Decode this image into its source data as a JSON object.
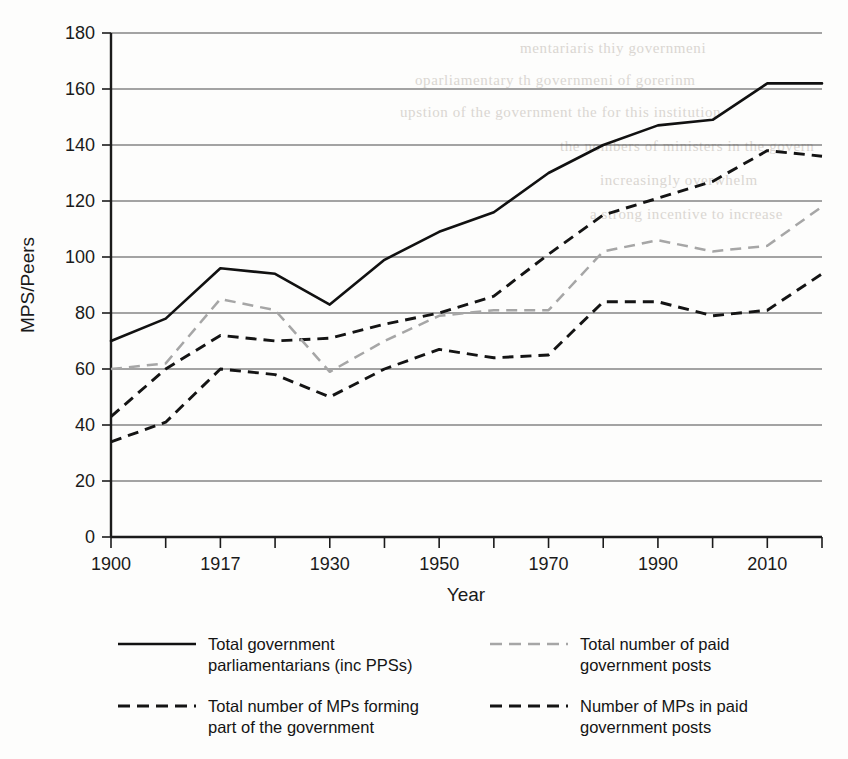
{
  "chart_data": {
    "type": "line",
    "title": "",
    "xlabel": "Year",
    "ylabel": "MPS/Peers",
    "ylim": [
      0,
      180
    ],
    "ytick_step": 20,
    "yticks": [
      0,
      20,
      40,
      60,
      80,
      100,
      120,
      140,
      160,
      180
    ],
    "grid": "horizontal",
    "legend_position": "below",
    "x": [
      1900,
      1910,
      1917,
      1924,
      1930,
      1940,
      1950,
      1960,
      1970,
      1980,
      1990,
      2000,
      2010,
      2020
    ],
    "xticks_labeled": [
      "1900",
      "",
      "1917",
      "",
      "1930",
      "",
      "1950",
      "",
      "1970",
      "",
      "1990",
      "",
      "2010",
      ""
    ],
    "xtick_labels_visible": [
      "1900",
      "1917",
      "1930",
      "1950",
      "1970",
      "1990",
      "2010"
    ],
    "series": [
      {
        "name": "Total government parliamentarians (inc PPSs)",
        "style": "solid",
        "color": "#111111",
        "values": [
          70,
          78,
          96,
          94,
          83,
          99,
          109,
          116,
          130,
          140,
          147,
          149,
          162,
          162
        ]
      },
      {
        "name": "Total number of MPs forming part of the government",
        "style": "dashed",
        "color": "#141414",
        "values": [
          43,
          60,
          72,
          70,
          71,
          76,
          80,
          86,
          101,
          115,
          121,
          127,
          138,
          136
        ]
      },
      {
        "name": "Total number of paid government posts",
        "style": "dashed-light",
        "color": "#a6a6a6",
        "values": [
          60,
          62,
          85,
          81,
          59,
          70,
          79,
          81,
          81,
          102,
          106,
          102,
          104,
          118
        ]
      },
      {
        "name": "Number of MPs in paid government posts",
        "style": "dashed",
        "color": "#141414",
        "values": [
          34,
          41,
          60,
          58,
          50,
          60,
          67,
          64,
          65,
          84,
          84,
          79,
          81,
          94
        ]
      }
    ]
  },
  "axes": {
    "y_title": "MPS/Peers",
    "x_title": "Year",
    "y_labels": [
      "180",
      "160",
      "140",
      "120",
      "100",
      "80",
      "60",
      "40",
      "20",
      "0"
    ],
    "x_labels": [
      "1900",
      "1917",
      "1930",
      "1950",
      "1970",
      "1990",
      "2010"
    ]
  },
  "legend": {
    "entries": [
      {
        "label": "Total government\nparliamentarians (inc PPSs)",
        "style": "solid",
        "color": "#111111"
      },
      {
        "label": "Total number of MPs forming\npart of the government",
        "style": "dashed",
        "color": "#141414"
      },
      {
        "label": "Total number of paid\ngovernment posts",
        "style": "dashed-light",
        "color": "#a6a6a6"
      },
      {
        "label": "Number of MPs in paid\ngovernment posts",
        "style": "dashed",
        "color": "#141414"
      }
    ]
  },
  "background_bleed": [
    "mentariaris  thiy  governmeni",
    "oparliamentary  th  governmeni  of  gorerinm",
    "upstion  of  the  government  the  for  this  institution",
    "the  nombers  of  ministers  in  the  govern",
    "increasingly  overwhelm",
    "a  strong  incentive  to  increase"
  ],
  "colors": {
    "axis": "#1b1b1b",
    "grid": "#4a4a4a",
    "solid_series": "#111111",
    "dark_dashed_series": "#141414",
    "light_dashed_series": "#a6a6a6",
    "page_background": "#fdfdfc"
  }
}
